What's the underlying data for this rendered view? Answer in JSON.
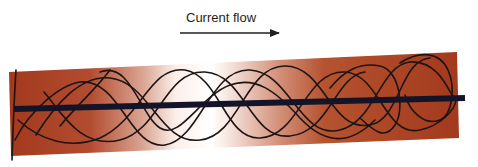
{
  "diagram": {
    "label": "Current flow",
    "arrow": {
      "x1": 180,
      "y1": 33,
      "x2": 279,
      "y2": 33,
      "direction": "right"
    },
    "conductor": {
      "colors": {
        "dark": "#a23a1f",
        "light": "#ffffff"
      },
      "corners": {
        "tl": [
          9,
          72
        ],
        "tr": [
          457,
          52
        ],
        "br": [
          459,
          138
        ],
        "bl": [
          11,
          156
        ]
      }
    },
    "axis_line": {
      "x1": 14,
      "y1": 109,
      "x2": 465,
      "y2": 98,
      "color": "#141428",
      "width": 6
    },
    "field_lines_color": "#1e1414"
  }
}
